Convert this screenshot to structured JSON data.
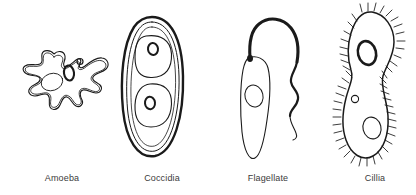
{
  "figure": {
    "width": 416,
    "height": 195,
    "background_color": "#ffffff",
    "ink_color": "#1a1a1a",
    "label_color": "#3b3b3b"
  },
  "organisms": [
    {
      "id": "amoeba",
      "label": "Amoeba",
      "icon": "amoeba-icon",
      "description": "Irregular blob-shaped cell with pseudopodia and a double outline membrane",
      "features": [
        "pseudopod-outline",
        "inner-membrane",
        "nucleus",
        "contractile-vacuole",
        "food-vacuole"
      ]
    },
    {
      "id": "coccidia",
      "label": "Coccidia",
      "icon": "coccidia-icon",
      "description": "Thick-walled oocyst oval containing two sporocysts each with a dark nucleus",
      "features": [
        "outer-wall",
        "inner-wall",
        "sporocyst-upper",
        "sporocyst-lower",
        "nucleus-upper",
        "nucleus-lower"
      ]
    },
    {
      "id": "flagellate",
      "label": "Flagellate",
      "icon": "flagellate-icon",
      "description": "Teardrop shaped cell with a single long whip-like flagellum and a nucleus",
      "features": [
        "cell-body",
        "nucleus",
        "flagellum",
        "basal-body"
      ]
    },
    {
      "id": "cillia",
      "label": "Cillia",
      "icon": "cillia-icon",
      "description": "Peanut shaped ciliate covered with short hair-like cilia, macronucleus, micronucleus and vacuole",
      "features": [
        "cell-body",
        "cilia-fringe",
        "macronucleus",
        "micronucleus",
        "vacuole"
      ]
    }
  ]
}
